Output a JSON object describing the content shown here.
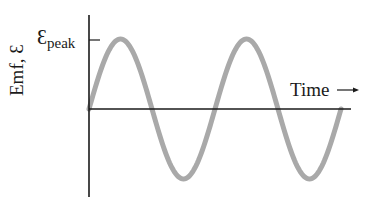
{
  "figure": {
    "y_axis_label": "Emf, Ɛ",
    "peak_symbol": "Ɛ",
    "peak_subscript": "peak",
    "x_axis_label": "Time",
    "x_arrow": "→"
  },
  "colors": {
    "axis": "#1a1a1a",
    "wave": "#a9a9a9",
    "background": "#ffffff"
  },
  "chart_data": {
    "type": "line",
    "title": "",
    "xlabel": "Time →",
    "ylabel": "Emf, Ɛ",
    "annotations": [
      "Ɛpeak (tick at peak value on y-axis)"
    ],
    "function": "Ɛ(t) = Ɛpeak · sin(ωt)",
    "cycles_shown": 2,
    "x": [
      0,
      0.25,
      0.5,
      0.75,
      1.0,
      1.25,
      1.5,
      1.75,
      2.0
    ],
    "x_units": "periods",
    "values": [
      0,
      1,
      0,
      -1,
      0,
      1,
      0,
      -1,
      0
    ],
    "y_units": "fraction of Ɛpeak",
    "ylim": [
      -1,
      1
    ],
    "grid": false,
    "legend": "none"
  }
}
